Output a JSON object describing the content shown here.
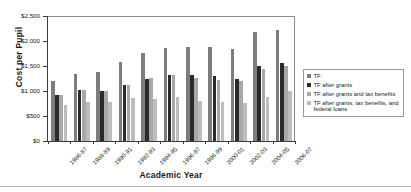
{
  "chart_data": {
    "type": "bar",
    "title": "",
    "xlabel": "Academic Year",
    "ylabel": "Cost per Pupil",
    "ylim": [
      0,
      2500
    ],
    "yticks": [
      0,
      500,
      1000,
      1500,
      2000,
      2500
    ],
    "ytick_labels": [
      "$0",
      "$500",
      "$1,000",
      "$1,500",
      "$2,000",
      "$2,500"
    ],
    "grid": false,
    "legend_position": "right",
    "categories": [
      "1986-87",
      "1988-89",
      "1990-91",
      "1992-93",
      "1994-95",
      "1996-97",
      "1998-99",
      "2000-01",
      "2002-03",
      "2004-05",
      "2006-07"
    ],
    "series": [
      {
        "name": "TF",
        "color": "#7d7d7d",
        "values": [
          1200,
          1345,
          1385,
          1585,
          1760,
          1855,
          1890,
          1885,
          1835,
          2175,
          2225
        ]
      },
      {
        "name": "TF after grants",
        "color": "#2a2a2a",
        "values": [
          920,
          1020,
          1000,
          1115,
          1250,
          1330,
          1315,
          1295,
          1235,
          1500,
          1560
        ]
      },
      {
        "name": "TF after grants and tax benefits",
        "color": "#a8a8a8",
        "values": [
          920,
          1020,
          1000,
          1115,
          1255,
          1330,
          1255,
          1220,
          1195,
          1435,
          1500
        ]
      },
      {
        "name": "TF after grants, tax benefits, and federal loans",
        "color": "#bdbdbd",
        "values": [
          720,
          780,
          785,
          860,
          850,
          875,
          800,
          785,
          755,
          890,
          1010
        ]
      }
    ]
  },
  "legend": {
    "items": [
      "TF",
      "TF after grants",
      "TF after grants and tax benefits",
      "TF after grants, tax benefits, and federal loans"
    ]
  }
}
